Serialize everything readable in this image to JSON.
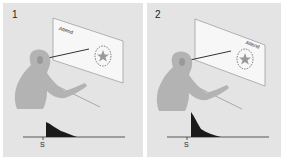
{
  "figure": {
    "panels": [
      {
        "number": "1",
        "screen_label": "Attend",
        "screen_label_position": "top-left",
        "stimulus": "star-in-dashed-circle",
        "response_axis_label": "S",
        "response_shape": "small-peak-decay"
      },
      {
        "number": "2",
        "screen_label": "Attend",
        "screen_label_position": "top-right-near-stimulus",
        "stimulus": "star-in-dashed-circle",
        "response_axis_label": "S",
        "response_shape": "large-peak-decay"
      }
    ],
    "colors": {
      "panel_bg": "#e4e4e4",
      "monkey": "#b3b3b3",
      "screen": "#f7f7f7",
      "response_fill": "#1a1a1a"
    }
  }
}
